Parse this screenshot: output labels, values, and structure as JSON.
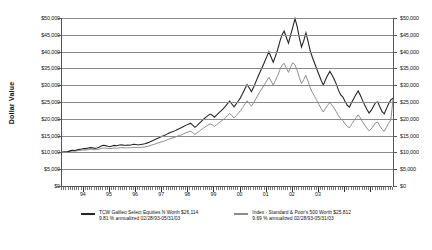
{
  "chart_data": {
    "type": "line",
    "title": "",
    "subtitle": "",
    "xlabel": "",
    "ylabel": "Dollar Value",
    "ylim": [
      0,
      50000
    ],
    "ytick_labels": [
      "$50,000",
      "$45,000",
      "$40,000",
      "$35,000",
      "$30,000",
      "$25,000",
      "$20,000",
      "$15,000",
      "$10,000",
      "$5,000",
      "$0"
    ],
    "ytick_values": [
      50000,
      45000,
      40000,
      35000,
      30000,
      25000,
      20000,
      15000,
      10000,
      5000,
      0
    ],
    "right_axis_labels": [
      "$50,000",
      "$45,000",
      "$40,000",
      "$35,000",
      "$30,000",
      "$25,000",
      "$20,000",
      "$15,000",
      "$10,000",
      "$5,000",
      "$0"
    ],
    "grid": true,
    "legend_position": "bottom",
    "xtick_labels": [
      "94",
      "95",
      "96",
      "97",
      "98",
      "99",
      "00",
      "01",
      "02",
      "03"
    ],
    "x_start": "02/28/93",
    "x_end": "05/31/03",
    "series": [
      {
        "name": "TCW Galileo Select Equities N",
        "color": "#262626",
        "ending_value": 26114,
        "ending_value_label": "$26,114",
        "annualized_return": "9.81 %",
        "period": "02/28/93-05/31/03",
        "values": [
          10000,
          10180,
          10090,
          10310,
          10520,
          10640,
          10580,
          10790,
          10900,
          11030,
          11180,
          11120,
          11290,
          11420,
          11360,
          11210,
          11330,
          11510,
          11880,
          12120,
          12020,
          11850,
          11700,
          11920,
          12090,
          11960,
          12110,
          12260,
          12180,
          12050,
          12210,
          12130,
          12260,
          12410,
          12340,
          12210,
          12330,
          12450,
          12580,
          12760,
          13010,
          13340,
          13620,
          13890,
          14220,
          14480,
          14770,
          15010,
          15360,
          15700,
          16020,
          16190,
          16480,
          16840,
          17100,
          17390,
          17760,
          18120,
          18410,
          18680,
          18120,
          17460,
          17980,
          18620,
          19240,
          19880,
          20410,
          20960,
          21390,
          21070,
          20480,
          21090,
          21760,
          22350,
          22940,
          23680,
          24510,
          25270,
          24410,
          23580,
          24420,
          25380,
          26310,
          27580,
          28940,
          30210,
          29180,
          28100,
          29420,
          30980,
          32540,
          34010,
          35420,
          36880,
          38420,
          39980,
          38410,
          36820,
          38560,
          40520,
          42880,
          44980,
          46120,
          44280,
          42510,
          44960,
          47280,
          49820,
          47410,
          44120,
          41380,
          43210,
          45580,
          43020,
          40180,
          38240,
          36520,
          34810,
          33120,
          31480,
          30020,
          31640,
          32980,
          34120,
          33020,
          31780,
          30240,
          28460,
          27120,
          26480,
          25180,
          24020,
          23480,
          24840,
          26060,
          27220,
          28310,
          27020,
          25480,
          24120,
          22860,
          21740,
          22480,
          23640,
          24860,
          25020,
          23480,
          22120,
          21480,
          23020,
          24480,
          25620,
          26114
        ]
      },
      {
        "name": "Index - Standard & Poor's 500",
        "color": "#8c8c8c",
        "ending_value": 25812,
        "ending_value_label": "$25,812",
        "annualized_return": "9.69 %",
        "period": "02/28/93-05/31/03",
        "values": [
          10000,
          10090,
          10040,
          10180,
          10310,
          10400,
          10360,
          10470,
          10560,
          10650,
          10740,
          10700,
          10820,
          10920,
          10880,
          10790,
          10860,
          10980,
          11180,
          11320,
          11260,
          11160,
          11080,
          11210,
          11320,
          11240,
          11330,
          11420,
          11380,
          11300,
          11400,
          11350,
          11430,
          11520,
          11470,
          11400,
          11470,
          11550,
          11640,
          11760,
          11920,
          12140,
          12340,
          12540,
          12790,
          12980,
          13200,
          13390,
          13660,
          13930,
          14190,
          14330,
          14560,
          14840,
          15050,
          15280,
          15580,
          15870,
          16110,
          16330,
          15890,
          15380,
          15790,
          16290,
          16770,
          17260,
          17680,
          18110,
          18450,
          18220,
          17740,
          18240,
          18780,
          19250,
          19720,
          20310,
          20960,
          21570,
          20910,
          20270,
          20940,
          21690,
          22410,
          23380,
          24420,
          25380,
          24580,
          23740,
          24760,
          25940,
          27080,
          28170,
          29160,
          30180,
          31280,
          32380,
          31240,
          30080,
          31380,
          32840,
          34480,
          35920,
          36520,
          35120,
          33820,
          35420,
          36680,
          36020,
          34380,
          32240,
          30480,
          31680,
          32920,
          31140,
          29180,
          27820,
          26640,
          25480,
          24280,
          23080,
          22020,
          23080,
          24020,
          24880,
          24080,
          23180,
          22080,
          20880,
          19980,
          19480,
          18520,
          17720,
          17320,
          18380,
          19380,
          20320,
          21180,
          20220,
          19120,
          18120,
          17220,
          16420,
          16980,
          17880,
          18820,
          18960,
          17820,
          16820,
          16320,
          17480,
          18680,
          19620,
          25812
        ]
      }
    ]
  },
  "legend": [
    {
      "line1": "TCW Galileo Select Equities N Worth $26,114",
      "line2": "9.81 % annualized 02/28/93-05/31/03",
      "color": "#262626"
    },
    {
      "line1": "Index - Standard & Poor's 500 Worth $25,812",
      "line2": "9.69 % annualized 02/28/93-05/31/03",
      "color": "#8c8c8c"
    }
  ]
}
